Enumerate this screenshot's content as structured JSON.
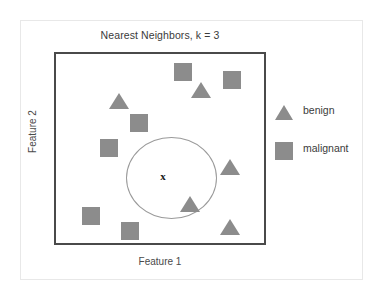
{
  "chart_data": {
    "type": "scatter",
    "title": "Nearest Neighbors, k = 3",
    "xlabel": "Feature 1",
    "ylabel": "Feature 2",
    "grid": false,
    "legend_position": "right",
    "marker_color": "#8c8c8c",
    "frame_color": "#4a4a4a",
    "circle_color": "#9a9a9a",
    "query_marker": "x",
    "query_label": "x",
    "series": [
      {
        "name": "benign",
        "marker": "triangle",
        "color": "#8c8c8c",
        "points": [
          {
            "x": 117,
            "y": 99,
            "in_neighborhood": true
          },
          {
            "x": 199,
            "y": 88,
            "in_neighborhood": false
          },
          {
            "x": 228,
            "y": 165,
            "in_neighborhood": false
          },
          {
            "x": 188,
            "y": 202,
            "in_neighborhood": false
          },
          {
            "x": 228,
            "y": 225,
            "in_neighborhood": false
          }
        ]
      },
      {
        "name": "malignant",
        "marker": "square",
        "color": "#8c8c8c",
        "points": [
          {
            "x": 137,
            "y": 121,
            "in_neighborhood": true
          },
          {
            "x": 107,
            "y": 146,
            "in_neighborhood": true
          },
          {
            "x": 181,
            "y": 70,
            "in_neighborhood": false
          },
          {
            "x": 230,
            "y": 78,
            "in_neighborhood": false
          },
          {
            "x": 89,
            "y": 214,
            "in_neighborhood": false
          },
          {
            "x": 128,
            "y": 229,
            "in_neighborhood": false
          }
        ]
      }
    ],
    "query_point": {
      "x": 107,
      "y": 123
    },
    "neighborhood": {
      "cx": 115,
      "cy": 124,
      "rx": 45,
      "ry": 41,
      "k": 3
    }
  },
  "legend": {
    "items": [
      {
        "label": "benign",
        "marker": "triangle"
      },
      {
        "label": "malignant",
        "marker": "square"
      }
    ]
  }
}
